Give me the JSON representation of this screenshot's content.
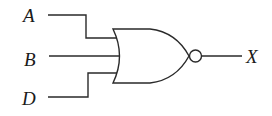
{
  "diagram": {
    "type": "logic-gate",
    "gate": "NOR",
    "inputs": [
      {
        "label": "A"
      },
      {
        "label": "B"
      },
      {
        "label": "D"
      }
    ],
    "output": {
      "label": "X"
    },
    "colors": {
      "stroke": "#2a2a2a",
      "background": "#ffffff"
    }
  }
}
